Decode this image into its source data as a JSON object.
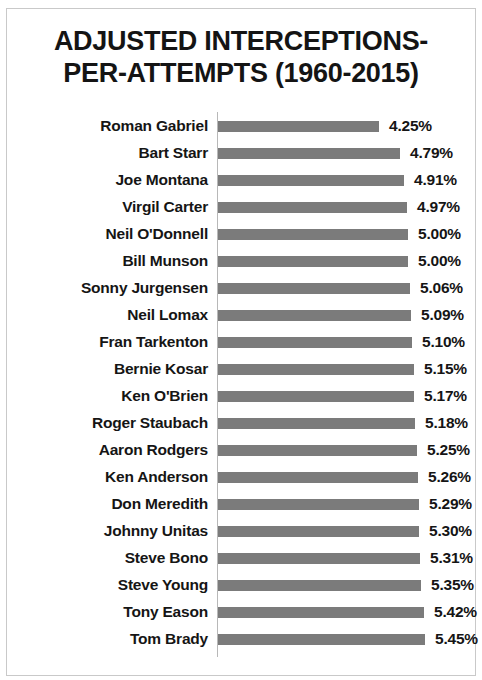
{
  "chart_data": {
    "type": "bar",
    "orientation": "horizontal",
    "title": "ADJUSTED INTERCEPTIONS-\nPER-ATTEMPTS (1960-2015)",
    "xlabel": "",
    "ylabel": "",
    "grid": false,
    "legend": null,
    "value_suffix": "%",
    "axis_min": 0,
    "axis_max": 5.45,
    "bar_color": "#7b7b7b",
    "text_color": "#151515",
    "categories": [
      "Roman Gabriel",
      "Bart Starr",
      "Joe Montana",
      "Virgil Carter",
      "Neil O'Donnell",
      "Bill Munson",
      "Sonny Jurgensen",
      "Neil Lomax",
      "Fran Tarkenton",
      "Bernie Kosar",
      "Ken O'Brien",
      "Roger Staubach",
      "Aaron Rodgers",
      "Ken Anderson",
      "Don Meredith",
      "Johnny Unitas",
      "Steve Bono",
      "Steve Young",
      "Tony Eason",
      "Tom Brady"
    ],
    "values": [
      4.25,
      4.79,
      4.91,
      4.97,
      5.0,
      5.0,
      5.06,
      5.09,
      5.1,
      5.15,
      5.17,
      5.18,
      5.25,
      5.26,
      5.29,
      5.3,
      5.31,
      5.35,
      5.42,
      5.45
    ],
    "value_labels": [
      "4.25%",
      "4.79%",
      "4.91%",
      "4.97%",
      "5.00%",
      "5.00%",
      "5.06%",
      "5.09%",
      "5.10%",
      "5.15%",
      "5.17%",
      "5.18%",
      "5.25%",
      "5.26%",
      "5.29%",
      "5.30%",
      "5.31%",
      "5.35%",
      "5.42%",
      "5.45%"
    ]
  }
}
